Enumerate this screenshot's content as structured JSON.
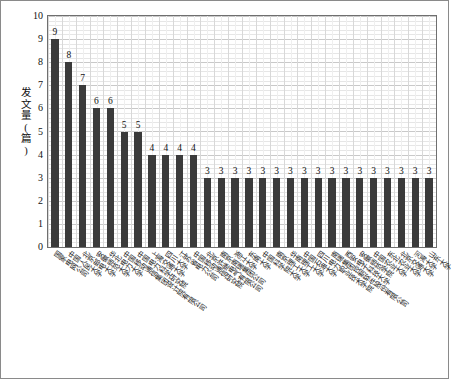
{
  "chart_data": {
    "type": "bar",
    "title": "",
    "xlabel": "",
    "ylabel": "发文量(篇)",
    "ylim": [
      0,
      10
    ],
    "ytick_labels": [
      "10",
      "9",
      "8",
      "7",
      "6",
      "5",
      "4",
      "3",
      "2",
      "1",
      "0"
    ],
    "grid": true,
    "legend": "none",
    "bar_color": "#3b3b3b",
    "categories": [
      "国家电网公司",
      "中国人民大学",
      "北京邮电大学",
      "安徽师范大学",
      "华北电力大学",
      "中国移动通信集团设计院有限公司",
      "中国电力科学研究院",
      "上海交通大学",
      "四川大学",
      "江苏省电力公司",
      "中国移动通信研究院",
      "北京许继电气有限公司",
      "南京南瑞集团公司",
      "浙江大学",
      "东南大学",
      "中国科学院大学",
      "南京理工大学",
      "华南理工大学",
      "中国石油大学",
      "四川电力职业技术学院",
      "南瑞集团控制软件股份有限公司",
      "西安电子科技大学",
      "安徽师范学院",
      "中国农业大学",
      "东北农业大学",
      "北京交通大学",
      "河海大学",
      "山东大学"
    ],
    "values": [
      9,
      8,
      7,
      6,
      6,
      5,
      5,
      4,
      4,
      4,
      4,
      3,
      3,
      3,
      3,
      3,
      3,
      3,
      3,
      3,
      3,
      3,
      3,
      3,
      3,
      3,
      3,
      3
    ],
    "data_labels": [
      "9",
      "8",
      "7",
      "6",
      "6",
      "5",
      "5",
      "4",
      "4",
      "4",
      "4",
      "3",
      "3",
      "3",
      "3",
      "3",
      "3",
      "3",
      "3",
      "3",
      "3",
      "3",
      "3",
      "3",
      "3",
      "3",
      "3",
      "3"
    ]
  }
}
